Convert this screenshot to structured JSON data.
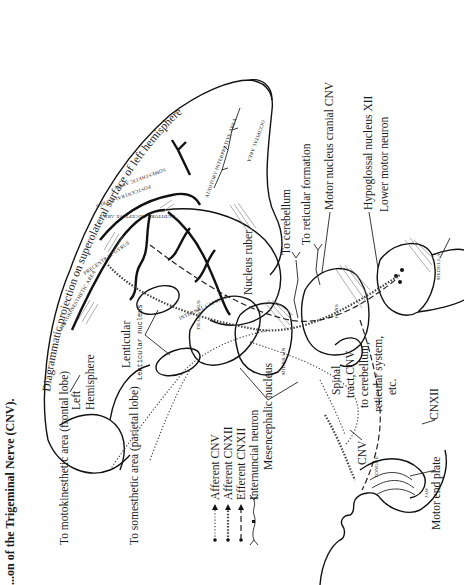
{
  "page": {
    "orientation": "rotated 90 degrees counter-clockwise",
    "title": "...on of the Trigeminal Nerve (CNV)."
  },
  "diagram": {
    "projection_caption": "Diagrammatic projection on superolateral surface of left hemisphere",
    "hemisphere_label": "Left Hemisphere",
    "hemisphere_label_line1": "Left",
    "hemisphere_label_line2": "Hemisphere",
    "lenticular_label": "Lenticular",
    "lenticular_sublabel": "Lenticular nucleus",
    "thalamus_label": "THALAMUS",
    "internal_capsule_label": "INTERNAL CAPSULE",
    "midbrain_label": "MIDBRAIN",
    "pons_label": "PONS",
    "medulla_label": "MEDULLA",
    "tongue_label": "TONGUE",
    "jaw_label": "JAW",
    "cortical_areas": {
      "motokinesthetic": "MOTOKINESTHETIC AREA",
      "precentral_gyrus": "PRECENTRAL GYRUS",
      "postcentral_gyrus": "POSTCENTRAL GYRUS",
      "somesthetic": "SOMESTHETIC AREA",
      "auditory_interpretive": "AUDITORY INTERPRETIVE AREA",
      "auditory_receptive": "AUDITORY RECEPTIVE AREA",
      "occipital": "OCCIPITAL AREA"
    },
    "labels": {
      "to_motokinesthetic": "To motokinesthetic area (frontal lobe)",
      "to_somesthetic": "To somesthetic area (parietal lobe)",
      "nucleus_ruber": "Nucleus ruber",
      "to_cerebellum": "To cerebellum",
      "to_reticular": "To reticular formation",
      "motor_nucleus": "Motor nucleus cranial CNV",
      "hypoglossal_nucleus": "Hypoglossal nucleus XII",
      "lower_motor_neuron": "Lower motor neuron",
      "mesencephalic_nucleus": "Mesencephalic nucleus",
      "spinal_tract_line1": "Spinal",
      "spinal_tract_line2": "tract,CNV",
      "spinal_tract_line3": "to cerebellum,",
      "spinal_tract_line4": "reticular system,",
      "spinal_tract_line5": "etc.",
      "cnv": "CNV",
      "cnxii": "CNXII",
      "motor_end_plate": "Motor end plate"
    },
    "legend": [
      {
        "label": "Afferent CNV",
        "style": "dotted"
      },
      {
        "label": "Afferent CNXII",
        "style": "beaded"
      },
      {
        "label": "Efferent CNXII",
        "style": "dashed"
      },
      {
        "label": "Internuncial neuron",
        "style": "branched"
      }
    ]
  }
}
